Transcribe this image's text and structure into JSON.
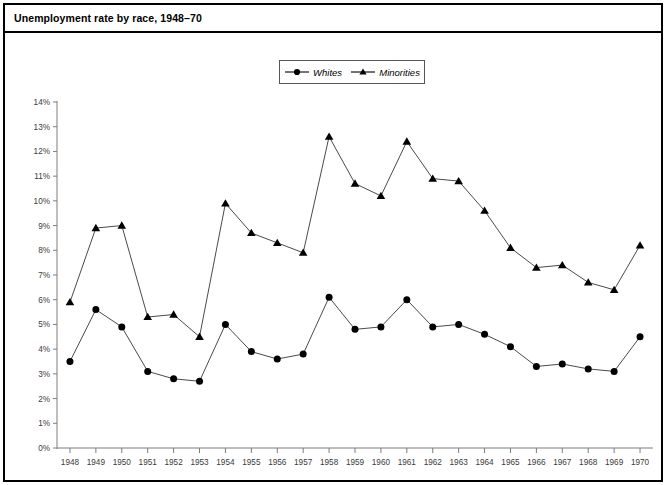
{
  "figure": {
    "title": "Unemployment rate by race, 1948–70"
  },
  "legend": {
    "position": "top-center",
    "entries": [
      {
        "label": "Whites",
        "marker": "circle-marker-icon",
        "color": "#000000"
      },
      {
        "label": "Minorities",
        "marker": "triangle-marker-icon",
        "color": "#000000"
      }
    ]
  },
  "axes": {
    "y": {
      "ticks": [
        "0%",
        "1%",
        "2%",
        "3%",
        "4%",
        "5%",
        "6%",
        "7%",
        "8%",
        "9%",
        "10%",
        "11%",
        "12%",
        "13%",
        "14%"
      ],
      "min": 0,
      "max": 14,
      "step": 1
    },
    "x": {
      "ticks": [
        "1948",
        "1949",
        "1950",
        "1951",
        "1952",
        "1953",
        "1954",
        "1955",
        "1956",
        "1957",
        "1958",
        "1959",
        "1960",
        "1961",
        "1962",
        "1963",
        "1964",
        "1965",
        "1966",
        "1967",
        "1968",
        "1969",
        "1970"
      ]
    }
  },
  "chart_data": {
    "type": "line",
    "title": "Unemployment rate by race, 1948–70",
    "xlabel": "",
    "ylabel": "",
    "ylim": [
      0,
      14
    ],
    "ytick_step": 1,
    "ytick_suffix": "%",
    "grid": false,
    "legend_position": "top-center",
    "categories": [
      1948,
      1949,
      1950,
      1951,
      1952,
      1953,
      1954,
      1955,
      1956,
      1957,
      1958,
      1959,
      1960,
      1961,
      1962,
      1963,
      1964,
      1965,
      1966,
      1967,
      1968,
      1969,
      1970
    ],
    "series": [
      {
        "name": "Whites",
        "marker": "circle",
        "color": "#000000",
        "values": [
          3.5,
          5.6,
          4.9,
          3.1,
          2.8,
          2.7,
          5.0,
          3.9,
          3.6,
          3.8,
          6.1,
          4.8,
          4.9,
          6.0,
          4.9,
          5.0,
          4.6,
          4.1,
          3.3,
          3.4,
          3.2,
          3.1,
          4.5
        ]
      },
      {
        "name": "Minorities",
        "marker": "triangle",
        "color": "#000000",
        "values": [
          5.9,
          8.9,
          9.0,
          5.3,
          5.4,
          4.5,
          9.9,
          8.7,
          8.3,
          7.9,
          12.6,
          10.7,
          10.2,
          12.4,
          10.9,
          10.8,
          9.6,
          8.1,
          7.3,
          7.4,
          6.7,
          6.4,
          8.2
        ]
      }
    ]
  }
}
